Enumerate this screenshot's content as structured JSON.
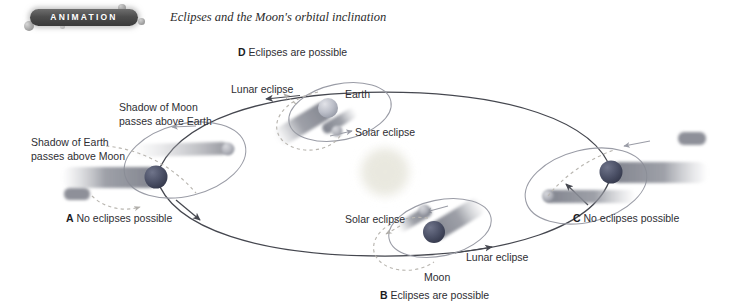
{
  "header": {
    "badge_label": "ANIMATION",
    "caption": "Eclipses and the Moon's orbital inclination",
    "badge_color": "#4d4d4d",
    "badge_text_color": "#ffffff"
  },
  "colors": {
    "earth_dark": "#4a4f63",
    "earth_light": "#b9bcc6",
    "shadow_gray": "#8d8f97",
    "moon_gray": "#9fa2ab",
    "sun_pale": "#e9e8e0",
    "earth_orbit_line": "#45474f",
    "moon_orbit_line": "#9a9ca6",
    "dashed_orbit": "#b9b6b0",
    "label_text": "#2e2e33"
  },
  "diagram": {
    "type": "orbital-diagram",
    "sun": {
      "name": "Sun",
      "cx": 385,
      "cy": 172,
      "r": 25
    },
    "positions": [
      {
        "id": "A",
        "marker": "A",
        "caption": "No eclipses possible",
        "eclipses_possible": false,
        "earth_cx": 156,
        "earth_cy": 177,
        "note_lines": [
          "Shadow of Earth",
          "passes above Moon"
        ]
      },
      {
        "id": "B",
        "marker": "B",
        "caption": "Eclipses are possible",
        "eclipses_possible": true,
        "earth_cx": 434,
        "earth_cy": 232,
        "moon_label": "Moon",
        "solar_label": "Solar eclipse",
        "lunar_label": "Lunar eclipse"
      },
      {
        "id": "C",
        "marker": "C",
        "caption": "No eclipses possible",
        "eclipses_possible": false,
        "earth_cx": 611,
        "earth_cy": 172
      },
      {
        "id": "D",
        "marker": "D",
        "caption": "Eclipses are possible",
        "eclipses_possible": true,
        "earth_cx": 328,
        "earth_cy": 108,
        "earth_label": "Earth",
        "solar_label": "Solar eclipse",
        "lunar_label": "Lunar eclipse"
      }
    ],
    "annotations": {
      "shadow_of_earth": "Shadow of Earth\npasses above Moon",
      "shadow_of_moon": "Shadow of Moon\npasses above Earth"
    }
  },
  "labels": {
    "d_marker": "D",
    "d_caption": "Eclipses are possible",
    "a_marker": "A",
    "a_caption": "No eclipses possible",
    "b_marker": "B",
    "b_caption": "Eclipses are possible",
    "c_marker": "C",
    "c_caption": "No eclipses possible",
    "lunar_eclipse_top": "Lunar eclipse",
    "lunar_eclipse_bottom": "Lunar eclipse",
    "solar_eclipse_top": "Solar eclipse",
    "solar_eclipse_bottom": "Solar eclipse",
    "earth": "Earth",
    "moon": "Moon",
    "shadow_earth_l1": "Shadow of Earth",
    "shadow_earth_l2": "passes above Moon",
    "shadow_moon_l1": "Shadow of Moon",
    "shadow_moon_l2": "passes above Earth"
  }
}
